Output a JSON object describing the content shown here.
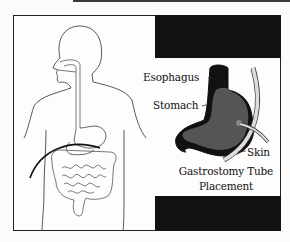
{
  "diagram": {
    "title_lines": [
      "Gastrostomy Tube",
      "Placement"
    ],
    "labels": {
      "esophagus": "Esophagus",
      "stomach": "Stomach",
      "skin": "Skin"
    },
    "colors": {
      "stomach_fill": "#555555",
      "stomach_wall": "#111111",
      "tube": "#dddddd",
      "outline": "#333333",
      "block": "#111111"
    }
  }
}
